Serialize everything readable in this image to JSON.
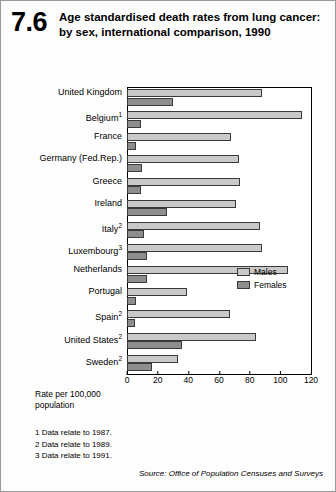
{
  "header": {
    "figure_number": "7.6",
    "title": "Age standardised death rates from lung cancer: by sex, international comparison, 1990"
  },
  "legend": {
    "males_label": "Males",
    "females_label": "Females"
  },
  "axis": {
    "rate_label": "Rate per 100,000 population"
  },
  "notes": [
    "1  Data relate to 1987.",
    "2  Data relate to 1989.",
    "3  Data relate to 1991."
  ],
  "source": "Source: Office of Population Censuses and Surveys",
  "colors": {
    "males": "#c9c9c9",
    "females": "#8e8e8e",
    "axis": "#000000"
  },
  "chart_data": {
    "type": "bar",
    "orientation": "horizontal",
    "title": "Age standardised death rates from lung cancer: by sex, international comparison, 1990",
    "xlabel": "Rate per 100,000 population",
    "ylabel": "",
    "xlim": [
      0,
      120
    ],
    "xticks": [
      0,
      20,
      40,
      60,
      80,
      100,
      120
    ],
    "grid": false,
    "legend_position": "inside-right",
    "categories": [
      "United Kingdom",
      "Belgium¹",
      "France",
      "Germany (Fed.Rep.)",
      "Greece",
      "Ireland",
      "Italy²",
      "Luxembourg³",
      "Netherlands",
      "Portugal",
      "Spain²",
      "United States²",
      "Sweden²"
    ],
    "category_notes": [
      {
        "name": "Belgium",
        "note": "1"
      },
      {
        "name": "Italy",
        "note": "2"
      },
      {
        "name": "Luxembourg",
        "note": "3"
      },
      {
        "name": "Spain",
        "note": "2"
      },
      {
        "name": "United States",
        "note": "2"
      },
      {
        "name": "Sweden",
        "note": "2"
      }
    ],
    "series": [
      {
        "name": "Males",
        "values": [
          88,
          114,
          68,
          73,
          74,
          71,
          87,
          88,
          105,
          39,
          67,
          84,
          33
        ]
      },
      {
        "name": "Females",
        "values": [
          30,
          9,
          6,
          10,
          9,
          26,
          11,
          13,
          13,
          6,
          5,
          36,
          16
        ]
      }
    ]
  }
}
